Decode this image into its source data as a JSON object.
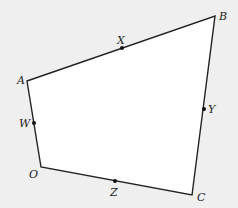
{
  "diagram": {
    "type": "quadrilateral-with-midpoints",
    "background": "#efefef",
    "fill": "#ffffff",
    "stroke": "#222222",
    "vertices": [
      {
        "name": "A",
        "x": 27,
        "y": 81,
        "label_x": 17,
        "label_y": 84
      },
      {
        "name": "B",
        "x": 215,
        "y": 16,
        "label_x": 219,
        "label_y": 20
      },
      {
        "name": "C",
        "x": 192,
        "y": 195,
        "label_x": 197,
        "label_y": 201
      },
      {
        "name": "O",
        "x": 41,
        "y": 167,
        "label_x": 29,
        "label_y": 178
      }
    ],
    "midpoints": [
      {
        "name": "X",
        "x": 122,
        "y": 48,
        "label_x": 117,
        "label_y": 44
      },
      {
        "name": "Y",
        "x": 204,
        "y": 109,
        "label_x": 208,
        "label_y": 113
      },
      {
        "name": "Z",
        "x": 115,
        "y": 181,
        "label_x": 110,
        "label_y": 196
      },
      {
        "name": "W",
        "x": 34,
        "y": 123,
        "label_x": 19,
        "label_y": 127
      }
    ]
  }
}
